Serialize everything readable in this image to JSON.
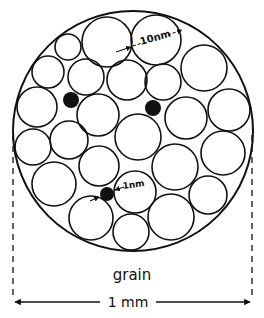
{
  "labels": {
    "crystallite_size": "10nm",
    "impurity_size": "1nm",
    "grain": "grain",
    "grain_size": "1 mm"
  },
  "colors": {
    "ink": "#111111",
    "background": "#ffffff"
  },
  "grain": {
    "cx": 133,
    "cy": 131,
    "r": 120
  },
  "crystallites": [
    {
      "cx": 107,
      "cy": 42,
      "r": 25
    },
    {
      "cx": 156,
      "cy": 40,
      "r": 25
    },
    {
      "cx": 68,
      "cy": 47,
      "r": 13
    },
    {
      "cx": 48,
      "cy": 72,
      "r": 16
    },
    {
      "cx": 86,
      "cy": 77,
      "r": 18
    },
    {
      "cx": 127,
      "cy": 80,
      "r": 20
    },
    {
      "cx": 163,
      "cy": 82,
      "r": 18
    },
    {
      "cx": 204,
      "cy": 68,
      "r": 23
    },
    {
      "cx": 37,
      "cy": 107,
      "r": 20
    },
    {
      "cx": 98,
      "cy": 115,
      "r": 21
    },
    {
      "cx": 186,
      "cy": 118,
      "r": 21
    },
    {
      "cx": 229,
      "cy": 110,
      "r": 21
    },
    {
      "cx": 138,
      "cy": 137,
      "r": 23
    },
    {
      "cx": 33,
      "cy": 147,
      "r": 18
    },
    {
      "cx": 69,
      "cy": 140,
      "r": 19
    },
    {
      "cx": 223,
      "cy": 153,
      "r": 22
    },
    {
      "cx": 54,
      "cy": 184,
      "r": 22
    },
    {
      "cx": 99,
      "cy": 166,
      "r": 20
    },
    {
      "cx": 175,
      "cy": 167,
      "r": 23
    },
    {
      "cx": 135,
      "cy": 192,
      "r": 21
    },
    {
      "cx": 208,
      "cy": 195,
      "r": 19
    },
    {
      "cx": 91,
      "cy": 218,
      "r": 22
    },
    {
      "cx": 171,
      "cy": 217,
      "r": 23
    },
    {
      "cx": 131,
      "cy": 232,
      "r": 18
    }
  ],
  "impurities": [
    {
      "cx": 71,
      "cy": 100,
      "r": 8
    },
    {
      "cx": 153,
      "cy": 108,
      "r": 8
    },
    {
      "cx": 107,
      "cy": 194,
      "r": 7
    }
  ]
}
